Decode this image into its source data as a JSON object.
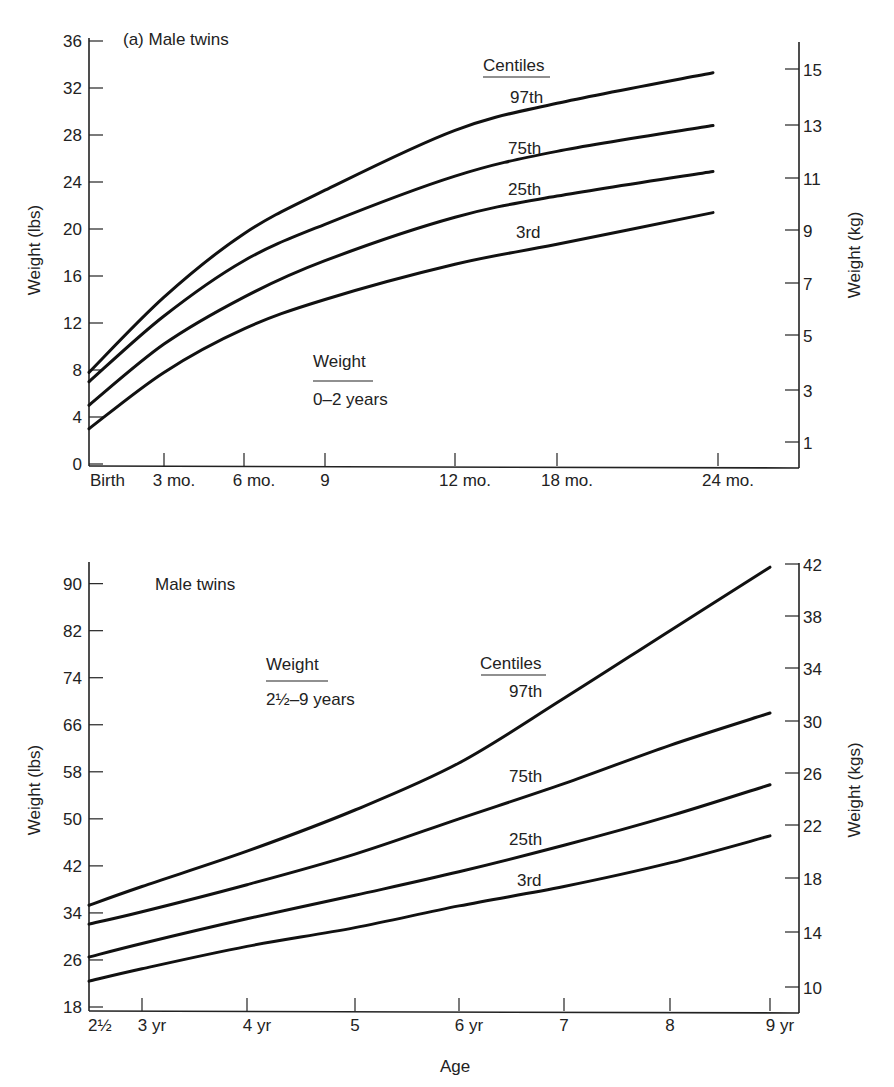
{
  "chart_data": [
    {
      "type": "line",
      "title": "(a) Male twins",
      "subtitle": "Weight 0–2 years",
      "legend_title": "Centiles",
      "xlabel": "",
      "ylabel": "Weight (lbs)",
      "ylabel_right": "Weight (kg)",
      "x_tick_labels": [
        "Birth",
        "3 mo.",
        "6 mo.",
        "9",
        "12 mo.",
        "18 mo.",
        "24 mo."
      ],
      "x_months": [
        0,
        3,
        6,
        9,
        12,
        18,
        24
      ],
      "y_ticks": [
        0,
        4,
        8,
        12,
        16,
        20,
        24,
        28,
        32,
        36
      ],
      "y_right_ticks": [
        1,
        3,
        5,
        7,
        9,
        11,
        13,
        15
      ],
      "ylim": [
        0,
        36
      ],
      "grid": false,
      "series": [
        {
          "name": "97th",
          "values": [
            7.8,
            14.2,
            19.6,
            23.3,
            28.4,
            30.7,
            33.3
          ]
        },
        {
          "name": "75th",
          "values": [
            7.0,
            12.6,
            17.3,
            20.4,
            24.5,
            26.6,
            28.8
          ]
        },
        {
          "name": "25th",
          "values": [
            5.0,
            10.2,
            14.2,
            17.3,
            21.0,
            22.8,
            24.9
          ]
        },
        {
          "name": "3rd",
          "values": [
            3.0,
            7.8,
            11.5,
            14.0,
            17.0,
            18.7,
            21.4
          ]
        }
      ]
    },
    {
      "type": "line",
      "title": "Male twins",
      "subtitle": "Weight 2½–9 years",
      "legend_title": "Centiles",
      "xlabel": "Age",
      "ylabel": "Weight (lbs)",
      "ylabel_right": "Weight (kgs)",
      "x_tick_labels": [
        "2½",
        "3 yr",
        "4 yr",
        "5",
        "6 yr",
        "7",
        "8",
        "9 yr"
      ],
      "x_years": [
        2.5,
        3,
        4,
        5,
        6,
        7,
        8,
        9
      ],
      "y_ticks": [
        18,
        26,
        34,
        42,
        50,
        58,
        66,
        74,
        82,
        90
      ],
      "y_right_ticks": [
        10,
        14,
        18,
        22,
        26,
        30,
        34,
        38,
        42
      ],
      "ylim": [
        18,
        94
      ],
      "grid": false,
      "series": [
        {
          "name": "97th",
          "values": [
            35.3,
            38.5,
            44.5,
            51.5,
            59.5,
            70.5,
            82.0,
            92.8
          ]
        },
        {
          "name": "75th",
          "values": [
            32.1,
            34.2,
            38.8,
            44.0,
            50.0,
            56.0,
            62.5,
            68.0
          ]
        },
        {
          "name": "25th",
          "values": [
            26.5,
            28.8,
            33.0,
            37.0,
            41.0,
            45.5,
            50.5,
            55.8
          ]
        },
        {
          "name": "3rd",
          "values": [
            22.4,
            24.5,
            28.3,
            31.5,
            35.2,
            38.5,
            42.5,
            47.1
          ]
        }
      ]
    }
  ]
}
